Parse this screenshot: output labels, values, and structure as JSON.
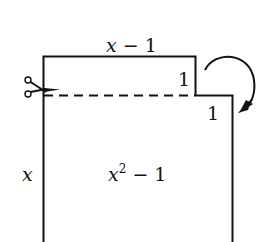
{
  "diagram": {
    "top_label": "x − 1",
    "top_label_var": "x",
    "top_label_rest": " − 1",
    "step_label_upper": "1",
    "step_label_lower": "1",
    "side_label": "x",
    "area_label_var": "x",
    "area_label_exp": "2",
    "area_label_rest": " − 1",
    "icons": {
      "cut": "scissors-icon",
      "rotate": "curved-arrow-clockwise-icon"
    },
    "colors": {
      "stroke": "#111111",
      "background": "#ffffff"
    }
  }
}
